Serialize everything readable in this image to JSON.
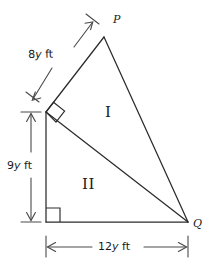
{
  "figure": {
    "background_color": "#ffffff",
    "stroke_color": "#2b2b2b",
    "text_color": "#1a1a1a"
  },
  "vertices": [
    {
      "id": "P",
      "label": "P",
      "x": 104,
      "y": 37
    },
    {
      "id": "Q",
      "label": "Q",
      "x": 188,
      "y": 222
    },
    {
      "id": "R",
      "label": "",
      "x": 46,
      "y": 112
    },
    {
      "id": "S",
      "label": "",
      "x": 46,
      "y": 222
    }
  ],
  "vertex_labels": {
    "p": "P",
    "q": "Q"
  },
  "regions": [
    {
      "id": "I",
      "label": "I",
      "x": 107,
      "y": 113
    },
    {
      "id": "II",
      "label": "II",
      "x": 88,
      "y": 185
    }
  ],
  "dimensions": [
    {
      "id": "pr",
      "value": "8",
      "variable": "y",
      "unit": "ft",
      "text": "8y ft",
      "orientation": "diagonal",
      "label_x": 28,
      "label_y": 49
    },
    {
      "id": "rs",
      "value": "9",
      "variable": "y",
      "unit": "ft",
      "text": "9y ft",
      "orientation": "vertical",
      "label_x": 7,
      "label_y": 160
    },
    {
      "id": "sq",
      "value": "12",
      "variable": "y",
      "unit": "ft",
      "text": "12y ft",
      "orientation": "horizontal",
      "label_x": 98,
      "label_y": 241
    }
  ],
  "right_angles": [
    {
      "id": "angle-at-r",
      "x": 46,
      "y": 112,
      "rotated": true
    },
    {
      "id": "angle-at-s",
      "x": 46,
      "y": 222,
      "rotated": false
    }
  ]
}
